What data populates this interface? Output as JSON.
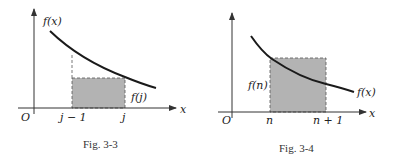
{
  "figures": [
    {
      "caption": "Fig. 3-3",
      "labels": {
        "fx": "f(x)",
        "fj": "f(j)",
        "origin": "O",
        "xaxis": "x",
        "left_tick": "j − 1",
        "right_tick": "j"
      },
      "description": "Decreasing curve f(x) with shaded rectangle on [j−1, j] of height f(j) lying under the curve"
    },
    {
      "caption": "Fig. 3-4",
      "labels": {
        "fx": "f(x)",
        "fn": "f(n)",
        "origin": "O",
        "xaxis": "x",
        "left_tick": "n",
        "right_tick": "n + 1"
      },
      "description": "Decreasing curve f(x) with shaded rectangle on [n, n+1] of height f(n) lying above the curve"
    }
  ],
  "colors": {
    "curve": "#1a1a1a",
    "axis": "#333333",
    "shade": "#b3b3b3",
    "dash": "#555555"
  }
}
